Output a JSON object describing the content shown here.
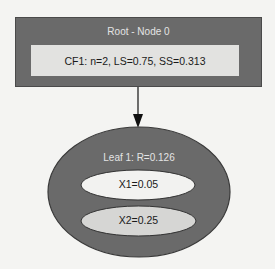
{
  "root": {
    "title": "Root - Node 0",
    "cf": "CF1: n=2, LS=0.75, SS=0.313"
  },
  "leaf": {
    "title": "Leaf 1: R=0.126",
    "entries": [
      {
        "label": "X1=0.05"
      },
      {
        "label": "X2=0.25"
      }
    ]
  },
  "colors": {
    "node_fill": "#6a6a6a",
    "cf_fill": "#e2e2e0",
    "x1_fill": "#f2f2f0",
    "x2_fill": "#d6d6d4",
    "background": "#f4f4f2"
  }
}
